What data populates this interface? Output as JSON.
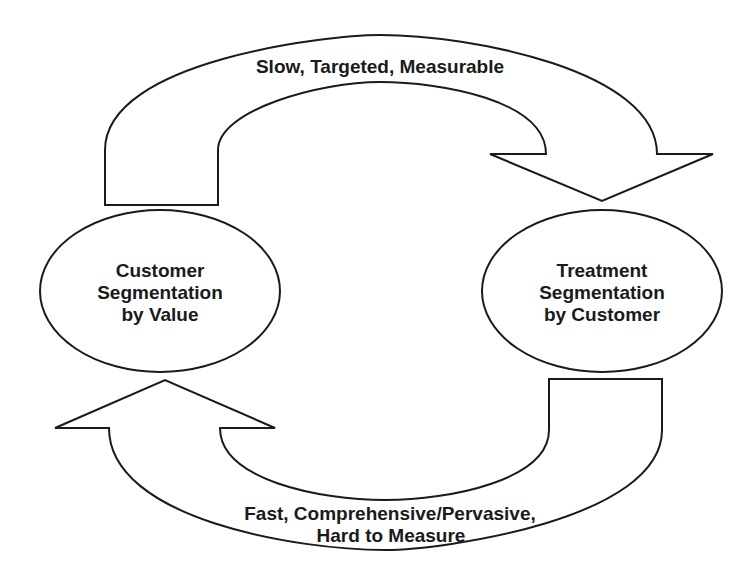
{
  "diagram": {
    "type": "cycle",
    "colors": {
      "stroke": "#1a1a1a",
      "fill": "#ffffff",
      "text": "#1a1a1a",
      "background": "#ffffff"
    },
    "nodes": [
      {
        "id": "customer-segmentation",
        "lines": [
          "Customer",
          "Segmentation",
          "by Value"
        ]
      },
      {
        "id": "treatment-segmentation",
        "lines": [
          "Treatment",
          "Segmentation",
          "by Customer"
        ]
      }
    ],
    "edges": [
      {
        "from": "customer-segmentation",
        "to": "treatment-segmentation",
        "direction": "clockwise-top",
        "label_lines": [
          "Slow, Targeted, Measurable"
        ]
      },
      {
        "from": "treatment-segmentation",
        "to": "customer-segmentation",
        "direction": "clockwise-bottom",
        "label_lines": [
          "Fast, Comprehensive/Pervasive,",
          "Hard to Measure"
        ]
      }
    ]
  }
}
